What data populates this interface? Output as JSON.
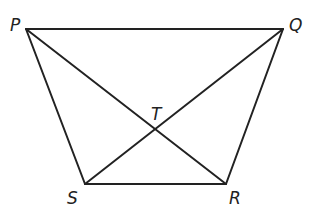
{
  "diagram": {
    "type": "trapezoid-with-diagonals",
    "points": {
      "P": {
        "label": "P",
        "x": 26,
        "y": 29
      },
      "Q": {
        "label": "Q",
        "x": 283,
        "y": 29
      },
      "R": {
        "label": "R",
        "x": 226,
        "y": 184
      },
      "S": {
        "label": "S",
        "x": 85,
        "y": 184
      },
      "T": {
        "label": "T",
        "x": 155,
        "y": 129
      }
    },
    "segments": [
      "PQ",
      "QR",
      "RS",
      "SP",
      "PR",
      "QS"
    ],
    "labels": {
      "P": "P",
      "Q": "Q",
      "R": "R",
      "S": "S",
      "T": "T"
    }
  }
}
